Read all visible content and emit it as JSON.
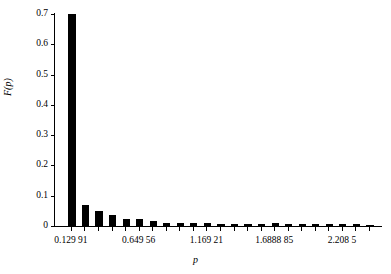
{
  "chart_data": {
    "type": "bar",
    "title": "",
    "subtitle": "",
    "xlabel": "p",
    "ylabel": "F(p)",
    "grid": false,
    "legend": null,
    "ylim": [
      0,
      0.7
    ],
    "xlim": [
      0.0,
      2.47
    ],
    "y_ticks": [
      {
        "value": 0,
        "label": "0"
      },
      {
        "value": 0.1,
        "label": "0.1"
      },
      {
        "value": 0.2,
        "label": "0.2"
      },
      {
        "value": 0.3,
        "label": "0.3"
      },
      {
        "value": 0.4,
        "label": "0.4"
      },
      {
        "value": 0.5,
        "label": "0.5"
      },
      {
        "value": 0.6,
        "label": "0.6"
      },
      {
        "value": 0.7,
        "label": "0.7"
      }
    ],
    "x_ticks": [
      {
        "value": 0.12991,
        "label": "0.129 91"
      },
      {
        "value": 0.64956,
        "label": "0.649 56"
      },
      {
        "value": 1.16921,
        "label": "1.169 21"
      },
      {
        "value": 1.688885,
        "label": "1.6888 85"
      },
      {
        "value": 2.2085,
        "label": "2.208 5"
      }
    ],
    "bar_color": "#000000",
    "bar_width": 0.055,
    "categories": [
      "0.129 91",
      "0.233 84",
      "0.337 77",
      "0.441 70",
      "0.545 63",
      "0.649 56",
      "0.753 49",
      "0.857 42",
      "0.961 35",
      "1.065 28",
      "1.169 21",
      "1.273 14",
      "1.377 07",
      "1.481 00",
      "1.584 93",
      "1.6888 85",
      "1.792 78",
      "1.896 71",
      "2.000 64",
      "2.104 57",
      "2.208 5",
      "2.312 43",
      "2.416 36"
    ],
    "x": [
      0.12991,
      0.23384,
      0.33777,
      0.4417,
      0.54563,
      0.64956,
      0.75349,
      0.85742,
      0.96135,
      1.06528,
      1.16921,
      1.27314,
      1.37707,
      1.481,
      1.58493,
      1.688885,
      1.79278,
      1.89671,
      2.00064,
      2.10457,
      2.2085,
      2.31243,
      2.41636
    ],
    "values": [
      0.7,
      0.068,
      0.05,
      0.038,
      0.022,
      0.022,
      0.018,
      0.01,
      0.01,
      0.01,
      0.009,
      0.008,
      0.008,
      0.007,
      0.007,
      0.009,
      0.007,
      0.007,
      0.006,
      0.006,
      0.008,
      0.006,
      0.005
    ]
  }
}
